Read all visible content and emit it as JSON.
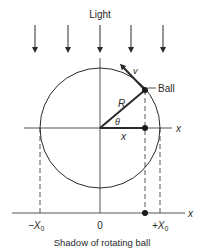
{
  "title": "Light",
  "caption": "Shadow of rotating ball",
  "labels": {
    "velocity": "v",
    "ball": "Ball",
    "radius": "R",
    "angle": "θ",
    "x_segment": "x",
    "x_axis_upper": "x",
    "x_axis_lower": "x",
    "neg_x0_main": "−X",
    "neg_x0_sub": "0",
    "origin": "0",
    "pos_x0_main": "+X",
    "pos_x0_sub": "0"
  },
  "colors": {
    "ink": "#2a2a2a",
    "background": "#ffffff"
  }
}
